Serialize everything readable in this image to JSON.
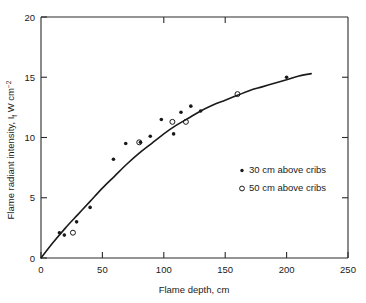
{
  "chart_data": {
    "type": "scatter",
    "title": "",
    "xlabel": "Flame depth, cm",
    "ylabel_main": "Flame radiant intensity, I",
    "ylabel_sub": "f",
    "ylabel_tail": " W cm",
    "ylabel_sup": "−2",
    "ylabel_full": "Flame radiant intensity, If W cm−2",
    "xlim": [
      0,
      250
    ],
    "ylim": [
      0,
      20
    ],
    "x_ticks": [
      0,
      50,
      100,
      150,
      200,
      250
    ],
    "x_tick_labels": [
      "0",
      "50",
      "100",
      "150",
      "200",
      "250"
    ],
    "y_ticks": [
      0,
      5,
      10,
      15,
      20
    ],
    "y_tick_labels": [
      "0",
      "5",
      "10",
      "15",
      "20"
    ],
    "grid": false,
    "legend_position": "center-right",
    "series": [
      {
        "name": "30 cm above cribs",
        "marker": "filled-circle",
        "color": "#1a1a1a",
        "points": [
          [
            15,
            2.1
          ],
          [
            19,
            1.9
          ],
          [
            29,
            3.0
          ],
          [
            40,
            4.2
          ],
          [
            59,
            8.2
          ],
          [
            69,
            9.5
          ],
          [
            81,
            9.6
          ],
          [
            89,
            10.1
          ],
          [
            98,
            11.5
          ],
          [
            108,
            10.3
          ],
          [
            114,
            12.1
          ],
          [
            122,
            12.6
          ],
          [
            130,
            12.2
          ],
          [
            200,
            15.0
          ]
        ]
      },
      {
        "name": "50 cm above cribs",
        "marker": "open-circle",
        "color": "#1a1a1a",
        "points": [
          [
            26,
            2.1
          ],
          [
            80,
            9.6
          ],
          [
            107,
            11.3
          ],
          [
            118,
            11.3
          ],
          [
            160,
            13.6
          ]
        ]
      }
    ],
    "fit_curve": {
      "name": "fitted curve",
      "description": "Smooth saturating curve from origin rising to about 15.3 W cm-2 at 220 cm",
      "points": [
        [
          0,
          0
        ],
        [
          10,
          1.3
        ],
        [
          20,
          2.5
        ],
        [
          30,
          3.6
        ],
        [
          40,
          4.7
        ],
        [
          50,
          5.8
        ],
        [
          60,
          6.8
        ],
        [
          70,
          7.8
        ],
        [
          80,
          8.7
        ],
        [
          90,
          9.5
        ],
        [
          100,
          10.3
        ],
        [
          110,
          11.0
        ],
        [
          120,
          11.6
        ],
        [
          130,
          12.2
        ],
        [
          140,
          12.7
        ],
        [
          150,
          13.1
        ],
        [
          160,
          13.5
        ],
        [
          170,
          13.9
        ],
        [
          180,
          14.2
        ],
        [
          190,
          14.5
        ],
        [
          200,
          14.8
        ],
        [
          210,
          15.1
        ],
        [
          220,
          15.3
        ]
      ]
    },
    "legend_entries": [
      {
        "marker": "filled-circle",
        "label": "30 cm above cribs"
      },
      {
        "marker": "open-circle",
        "label": "50 cm above cribs"
      }
    ]
  }
}
